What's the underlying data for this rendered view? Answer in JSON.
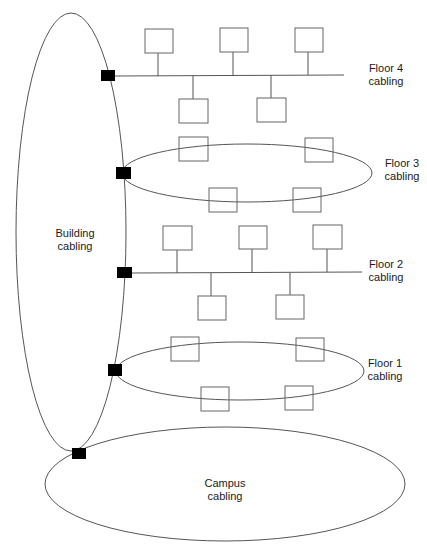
{
  "diagram": {
    "colors": {
      "line": "#555555",
      "node": "#000000",
      "background": "#ffffff",
      "text": "#1a1a1a"
    },
    "labels": {
      "building": "Building\ncabling",
      "campus": "Campus\ncabling",
      "floor4": "Floor 4\ncabling",
      "floor3": "Floor 3\ncabling",
      "floor2": "Floor 2\ncabling",
      "floor1": "Floor 1\ncabling"
    },
    "segments": [
      {
        "name": "Floor 4",
        "topology": "bus",
        "devices": 5
      },
      {
        "name": "Floor 3",
        "topology": "ring",
        "devices": 4
      },
      {
        "name": "Floor 2",
        "topology": "bus",
        "devices": 5
      },
      {
        "name": "Floor 1",
        "topology": "ring",
        "devices": 4
      },
      {
        "name": "Building",
        "topology": "ring",
        "connection_points": 5
      },
      {
        "name": "Campus",
        "topology": "ring",
        "connection_points": 1
      }
    ]
  }
}
